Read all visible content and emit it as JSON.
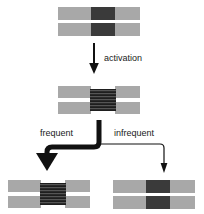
{
  "diagram": {
    "colors": {
      "segment_gray": "#a8a8a8",
      "core_dark": "#3a3a3a",
      "core_striped": "#2d2d2d",
      "background": "#ffffff",
      "arrow": "#111111",
      "text": "#1a1a1a"
    },
    "labels": {
      "activation": "activation",
      "frequent": "frequent",
      "infrequent": "infrequent"
    },
    "nodes": {
      "top": {
        "name": "inactive-complex-top",
        "state": "inactive",
        "core_style": "solid"
      },
      "middle": {
        "name": "activated-complex-middle",
        "state": "activated",
        "core_style": "striped"
      },
      "bottom_left": {
        "name": "activated-complex-outcome",
        "state": "activated",
        "core_style": "striped"
      },
      "bottom_right": {
        "name": "inactive-complex-outcome",
        "state": "inactive",
        "core_style": "solid"
      }
    },
    "arrows": {
      "activation": {
        "name": "activation-arrow",
        "weight": "normal",
        "direction": "down"
      },
      "frequent": {
        "name": "frequent-branch-arrow",
        "weight": "bold",
        "direction": "down-left"
      },
      "infrequent": {
        "name": "infrequent-branch-arrow",
        "weight": "thin",
        "direction": "down-right"
      }
    }
  }
}
